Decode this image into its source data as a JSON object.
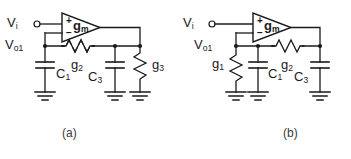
{
  "figure": {
    "type": "electronic-circuit-schematic",
    "panel_count": 2,
    "line_color": "#1a1a1a",
    "background_color": "#ffffff"
  },
  "captions": [
    {
      "id": "caption-a",
      "text": "(a)"
    },
    {
      "id": "caption-b",
      "text": "(b)"
    }
  ],
  "panel_a": {
    "caption": "(a)",
    "input_label": {
      "base": "V",
      "sub": "i"
    },
    "output_node_label": {
      "base": "V",
      "sub": "o1"
    },
    "amplifier": {
      "label_base": "g",
      "label_sub": "m",
      "plus_sign": "+",
      "minus_sign": "−",
      "shape": "triangle-right"
    },
    "components": [
      {
        "name": "C1",
        "base": "C",
        "sub": "1",
        "kind": "capacitor",
        "to": "ground"
      },
      {
        "name": "g2",
        "base": "g",
        "sub": "2",
        "kind": "resistor",
        "orientation": "horizontal"
      },
      {
        "name": "C3",
        "base": "C",
        "sub": "3",
        "kind": "capacitor",
        "to": "ground"
      },
      {
        "name": "g3",
        "base": "g",
        "sub": "3",
        "kind": "resistor",
        "orientation": "vertical",
        "to": "ground"
      }
    ]
  },
  "panel_b": {
    "caption": "(b)",
    "input_label": {
      "base": "V",
      "sub": "i"
    },
    "output_node_label": {
      "base": "V",
      "sub": "o1"
    },
    "amplifier": {
      "label_base": "g",
      "label_sub": "m",
      "plus_sign": "+",
      "minus_sign": "−",
      "shape": "triangle-right"
    },
    "components": [
      {
        "name": "g1",
        "base": "g",
        "sub": "1",
        "kind": "resistor",
        "orientation": "vertical",
        "to": "ground"
      },
      {
        "name": "C1",
        "base": "C",
        "sub": "1",
        "kind": "capacitor",
        "to": "ground"
      },
      {
        "name": "g2",
        "base": "g",
        "sub": "2",
        "kind": "resistor",
        "orientation": "horizontal"
      },
      {
        "name": "C3",
        "base": "C",
        "sub": "3",
        "kind": "capacitor",
        "to": "ground"
      }
    ]
  }
}
